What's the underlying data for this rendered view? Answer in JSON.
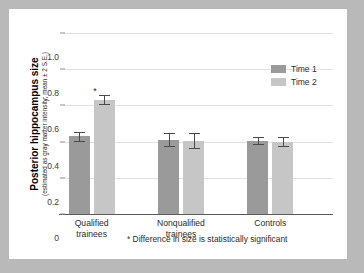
{
  "chart_data": {
    "type": "bar",
    "title": "",
    "xlabel": "",
    "ylabel": "Posterior hippocampus size",
    "ylabel_sub": "(estimated as gray matter intensity; mean ± 2 S.E.)",
    "categories": [
      "Qualified trainees",
      "Nonqualified trainees",
      "Controls"
    ],
    "category_lines": [
      [
        "Qualified",
        "trainees"
      ],
      [
        "Nonqualified",
        "trainees"
      ],
      [
        "Controls"
      ]
    ],
    "series": [
      {
        "name": "Time 1",
        "color": "#9a9a9a",
        "values": [
          0.43,
          0.41,
          0.405
        ],
        "errors": [
          0.025,
          0.035,
          0.02
        ]
      },
      {
        "name": "Time 2",
        "color": "#c6c6c6",
        "values": [
          0.63,
          0.405,
          0.4
        ],
        "errors": [
          0.025,
          0.04,
          0.025
        ]
      }
    ],
    "annotations": [
      {
        "label": "*",
        "series": "Time 2",
        "category": "Qualified trainees"
      }
    ],
    "ylim": [
      0,
      1.0
    ],
    "yticks": [
      1.0,
      0.8,
      0.6,
      0.4,
      0.2,
      0
    ],
    "ytick_labels": [
      "1.0",
      "0.8",
      "0.6",
      "0.4",
      "0.2",
      "0"
    ],
    "grid": true,
    "legend_position": "top-right",
    "footnote": "* Difference in size is statistically significant"
  },
  "colors": {
    "page_background": "#b9b9b9",
    "panel_background": "#ffffff",
    "gridline": "#e2e2e2",
    "axis": "#5a5a5a",
    "text": "#2b2b2b"
  }
}
